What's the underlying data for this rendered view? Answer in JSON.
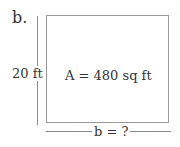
{
  "diagram": {
    "part_label": "b.",
    "shape": "rectangle",
    "height_label": "20 ft",
    "area_label": "A = 480 sq ft",
    "base_label": "b = ?",
    "colors": {
      "line": "#9a9a9a",
      "text": "#333333",
      "background": "#ffffff"
    }
  }
}
